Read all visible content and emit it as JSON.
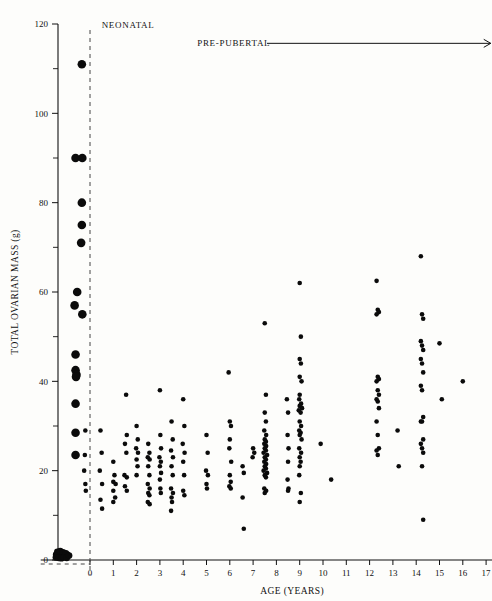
{
  "chart_data": {
    "type": "scatter",
    "title": "",
    "xlabel": "AGE (YEARS)",
    "ylabel": "TOTAL OVARIAN MASS (g)",
    "xlim": [
      -1.6,
      17.4
    ],
    "ylim": [
      0,
      120
    ],
    "xticks": [
      0,
      1,
      2,
      3,
      4,
      5,
      6,
      7,
      8,
      9,
      10,
      11,
      12,
      13,
      14,
      15,
      16,
      17
    ],
    "xticklabels": [
      "0",
      "1",
      "2",
      "3",
      "4",
      "5",
      "6",
      "7",
      "8",
      "9",
      "10",
      "11",
      "12",
      "13",
      "14",
      "15",
      "16",
      "17"
    ],
    "yticks": [
      0,
      20,
      40,
      60,
      80,
      100,
      120
    ],
    "yticklabels": [
      "0",
      "20",
      "40",
      "60",
      "80",
      "100",
      "120"
    ],
    "yminorticks": [
      10,
      30,
      50,
      70,
      90,
      110
    ],
    "grid": false,
    "legend": null,
    "annotations": [
      {
        "id": "foetal",
        "text": "FOETAL",
        "x": -1.0,
        "y": 126
      },
      {
        "id": "neonatal",
        "text": "NEONATAL",
        "x": 0.5,
        "y": 119
      },
      {
        "id": "pre-pubertal",
        "text": "PRE-PUBERTAL",
        "x": 4.6,
        "y": 115,
        "arrow_to_x": 17.2
      }
    ],
    "divider_x": 0,
    "series": [
      {
        "name": "foetal",
        "marker": "filled-circle",
        "marker_size": 4.3,
        "color": "#0b0b0b",
        "points": [
          [
            -0.35,
            111
          ],
          [
            -0.62,
            90
          ],
          [
            -0.33,
            90
          ],
          [
            -0.35,
            80
          ],
          [
            -0.35,
            75
          ],
          [
            -0.38,
            71
          ],
          [
            -0.55,
            60
          ],
          [
            -0.66,
            57
          ],
          [
            -0.33,
            55
          ],
          [
            -0.62,
            46
          ],
          [
            -0.62,
            42.5
          ],
          [
            -0.58,
            41.5
          ],
          [
            -0.6,
            41
          ],
          [
            -0.62,
            35
          ],
          [
            -0.62,
            28.5
          ],
          [
            -0.62,
            23.5
          ]
        ]
      },
      {
        "name": "foetal-baseline",
        "marker": "filled-circle",
        "marker_size": 3.4,
        "color": "#0b0b0b",
        "points": [
          [
            -1.45,
            1.2
          ],
          [
            -1.32,
            1.3
          ],
          [
            -1.2,
            1.1
          ],
          [
            -1.08,
            1.4
          ],
          [
            -1.35,
            0.8
          ],
          [
            -1.22,
            0.7
          ],
          [
            -1.1,
            0.9
          ],
          [
            -0.98,
            1.2
          ],
          [
            -1.4,
            1.8
          ],
          [
            -1.28,
            2.0
          ],
          [
            -1.16,
            1.7
          ],
          [
            -1.04,
            1.5
          ],
          [
            -1.46,
            0.6
          ],
          [
            -1.34,
            0.5
          ],
          [
            -1.23,
            0.4
          ],
          [
            -1.12,
            0.6
          ],
          [
            -1.0,
            0.5
          ],
          [
            -0.9,
            1.0
          ]
        ]
      },
      {
        "name": "pre-pubertal",
        "marker": "filled-circle",
        "marker_size": 2.3,
        "color": "#0b0b0b",
        "points": [
          [
            -0.2,
            29
          ],
          [
            -0.22,
            23.5
          ],
          [
            -0.25,
            20
          ],
          [
            -0.2,
            17
          ],
          [
            -0.18,
            15.5
          ],
          [
            0.45,
            29
          ],
          [
            0.5,
            24
          ],
          [
            0.42,
            20
          ],
          [
            0.52,
            17
          ],
          [
            0.45,
            13.5
          ],
          [
            0.52,
            11.5
          ],
          [
            1.0,
            22
          ],
          [
            1.05,
            19
          ],
          [
            1.0,
            17.5
          ],
          [
            1.1,
            17
          ],
          [
            1.0,
            15.5
          ],
          [
            1.08,
            14
          ],
          [
            1.0,
            13
          ],
          [
            1.55,
            37
          ],
          [
            1.58,
            28
          ],
          [
            1.5,
            26
          ],
          [
            1.56,
            24
          ],
          [
            1.48,
            19
          ],
          [
            1.58,
            18.5
          ],
          [
            1.5,
            16.5
          ],
          [
            1.58,
            15.5
          ],
          [
            2.0,
            30
          ],
          [
            2.05,
            27
          ],
          [
            1.98,
            25
          ],
          [
            2.06,
            24
          ],
          [
            2.0,
            22.5
          ],
          [
            2.04,
            21
          ],
          [
            2.0,
            19
          ],
          [
            2.5,
            26
          ],
          [
            2.55,
            24
          ],
          [
            2.48,
            23
          ],
          [
            2.56,
            22.5
          ],
          [
            2.5,
            21
          ],
          [
            2.55,
            19
          ],
          [
            2.48,
            17
          ],
          [
            2.56,
            16
          ],
          [
            2.5,
            15
          ],
          [
            2.55,
            14.5
          ],
          [
            2.48,
            13
          ],
          [
            2.56,
            12.5
          ],
          [
            3.0,
            38
          ],
          [
            3.02,
            28
          ],
          [
            3.05,
            25
          ],
          [
            2.98,
            23
          ],
          [
            3.04,
            22
          ],
          [
            3.0,
            21
          ],
          [
            3.05,
            19.5
          ],
          [
            3.0,
            18
          ],
          [
            3.02,
            16
          ],
          [
            3.04,
            15
          ],
          [
            3.5,
            31
          ],
          [
            3.55,
            27
          ],
          [
            3.48,
            24.5
          ],
          [
            3.56,
            23
          ],
          [
            3.5,
            21
          ],
          [
            3.55,
            19
          ],
          [
            3.48,
            16
          ],
          [
            3.56,
            15
          ],
          [
            3.5,
            14
          ],
          [
            3.52,
            13
          ],
          [
            3.48,
            11
          ],
          [
            4.0,
            36
          ],
          [
            4.05,
            30
          ],
          [
            3.98,
            26
          ],
          [
            4.06,
            24
          ],
          [
            4.0,
            22
          ],
          [
            4.04,
            19
          ],
          [
            4.0,
            15.5
          ],
          [
            4.05,
            14.5
          ],
          [
            5.0,
            28
          ],
          [
            5.05,
            24
          ],
          [
            4.98,
            20
          ],
          [
            5.06,
            19
          ],
          [
            5.0,
            17
          ],
          [
            5.02,
            16
          ],
          [
            5.95,
            42
          ],
          [
            6.0,
            31
          ],
          [
            6.05,
            30
          ],
          [
            6.0,
            27
          ],
          [
            5.98,
            25
          ],
          [
            6.06,
            22
          ],
          [
            6.0,
            19
          ],
          [
            6.04,
            17.5
          ],
          [
            5.98,
            16.5
          ],
          [
            6.04,
            16
          ],
          [
            6.55,
            21
          ],
          [
            6.6,
            19.5
          ],
          [
            6.55,
            14
          ],
          [
            6.6,
            7
          ],
          [
            7.0,
            25
          ],
          [
            7.05,
            24
          ],
          [
            6.98,
            23
          ],
          [
            7.5,
            53
          ],
          [
            7.55,
            37
          ],
          [
            7.5,
            33
          ],
          [
            7.55,
            31
          ],
          [
            7.48,
            29
          ],
          [
            7.56,
            28
          ],
          [
            7.5,
            27
          ],
          [
            7.55,
            26.5
          ],
          [
            7.48,
            26
          ],
          [
            7.56,
            25.5
          ],
          [
            7.5,
            25
          ],
          [
            7.55,
            24.5
          ],
          [
            7.45,
            24
          ],
          [
            7.6,
            23.5
          ],
          [
            7.5,
            23
          ],
          [
            7.55,
            22.5
          ],
          [
            7.48,
            22
          ],
          [
            7.56,
            21.5
          ],
          [
            7.5,
            21
          ],
          [
            7.55,
            20.5
          ],
          [
            7.45,
            20
          ],
          [
            7.6,
            19.5
          ],
          [
            7.5,
            19
          ],
          [
            7.55,
            18.5
          ],
          [
            7.48,
            16
          ],
          [
            7.56,
            15.5
          ],
          [
            7.5,
            15
          ],
          [
            8.45,
            36
          ],
          [
            8.5,
            33
          ],
          [
            8.48,
            28
          ],
          [
            8.52,
            25
          ],
          [
            8.5,
            22
          ],
          [
            8.48,
            18
          ],
          [
            8.52,
            16
          ],
          [
            8.5,
            15.5
          ],
          [
            9.0,
            62
          ],
          [
            9.05,
            50
          ],
          [
            9.0,
            45
          ],
          [
            9.05,
            44
          ],
          [
            9.0,
            41
          ],
          [
            9.08,
            40
          ],
          [
            9.0,
            37
          ],
          [
            8.98,
            36
          ],
          [
            9.06,
            35
          ],
          [
            9.0,
            34.5
          ],
          [
            9.1,
            34
          ],
          [
            8.96,
            33.5
          ],
          [
            9.04,
            33
          ],
          [
            9.0,
            31
          ],
          [
            9.06,
            30
          ],
          [
            8.98,
            29
          ],
          [
            9.04,
            28.5
          ],
          [
            9.0,
            28
          ],
          [
            9.08,
            27
          ],
          [
            8.98,
            25
          ],
          [
            9.06,
            24
          ],
          [
            9.0,
            23
          ],
          [
            9.04,
            22
          ],
          [
            9.0,
            21
          ],
          [
            8.98,
            19
          ],
          [
            9.05,
            15
          ],
          [
            9.0,
            13
          ],
          [
            9.9,
            26
          ],
          [
            10.35,
            18
          ],
          [
            12.3,
            62.5
          ],
          [
            12.35,
            56
          ],
          [
            12.4,
            55.5
          ],
          [
            12.3,
            55
          ],
          [
            12.35,
            41
          ],
          [
            12.4,
            40.5
          ],
          [
            12.3,
            40
          ],
          [
            12.35,
            38
          ],
          [
            12.4,
            37
          ],
          [
            12.3,
            36
          ],
          [
            12.35,
            35.5
          ],
          [
            12.4,
            34
          ],
          [
            12.3,
            31
          ],
          [
            12.35,
            28
          ],
          [
            12.4,
            25
          ],
          [
            12.3,
            24.5
          ],
          [
            12.35,
            23.5
          ],
          [
            13.2,
            29
          ],
          [
            13.25,
            21
          ],
          [
            14.2,
            68
          ],
          [
            14.25,
            55
          ],
          [
            14.3,
            54
          ],
          [
            14.2,
            49
          ],
          [
            14.25,
            48
          ],
          [
            14.3,
            47
          ],
          [
            14.2,
            45
          ],
          [
            14.25,
            44
          ],
          [
            14.3,
            42
          ],
          [
            14.2,
            39
          ],
          [
            14.25,
            38
          ],
          [
            14.3,
            32
          ],
          [
            14.2,
            31
          ],
          [
            14.25,
            31
          ],
          [
            14.3,
            27
          ],
          [
            14.2,
            26
          ],
          [
            14.25,
            25
          ],
          [
            14.3,
            24
          ],
          [
            14.25,
            21
          ],
          [
            14.3,
            9
          ],
          [
            15.0,
            48.5
          ],
          [
            15.1,
            36
          ],
          [
            16.0,
            40
          ]
        ]
      }
    ]
  }
}
